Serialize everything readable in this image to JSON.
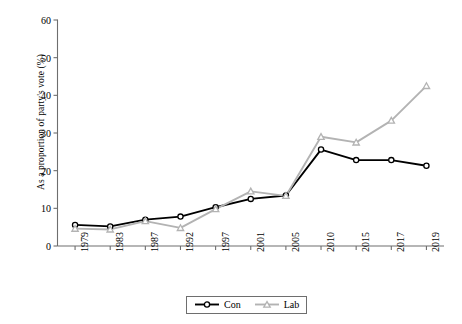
{
  "chart_data": {
    "type": "line",
    "title": "",
    "subtitle": "",
    "xlabel": "",
    "ylabel": "As a proportion of party's vote (%)",
    "categories": [
      "1979",
      "1983",
      "1987",
      "1992",
      "1997",
      "2001",
      "2005",
      "2010",
      "2015",
      "2017",
      "2019"
    ],
    "x": [
      1979,
      1983,
      1987,
      1992,
      1997,
      2001,
      2005,
      2010,
      2015,
      2017,
      2019
    ],
    "ylim": [
      0,
      60
    ],
    "yticks": [
      0,
      10,
      20,
      30,
      40,
      50,
      60
    ],
    "grid": false,
    "legend_position": "bottom-center",
    "series": [
      {
        "name": "Con",
        "color": "#000000",
        "marker": "circle",
        "values": [
          5.6,
          5.2,
          7.0,
          7.8,
          10.3,
          12.5,
          13.4,
          25.6,
          22.8,
          22.8,
          21.3
        ]
      },
      {
        "name": "Lab",
        "color": "#b3b3b3",
        "marker": "triangle",
        "values": [
          4.6,
          4.4,
          6.6,
          4.8,
          9.8,
          14.5,
          13.3,
          29.0,
          27.5,
          33.3,
          42.5
        ]
      }
    ]
  },
  "axes": {
    "y_tick_labels": [
      "0",
      "10",
      "20",
      "30",
      "40",
      "50",
      "60"
    ],
    "x_tick_labels": [
      "1979",
      "1983",
      "1987",
      "1992",
      "1997",
      "2001",
      "2005",
      "2010",
      "2015",
      "2017",
      "2019"
    ],
    "y_title": "As a proportion of party's vote (%)"
  },
  "legend": {
    "entries": [
      {
        "label": "Con",
        "color": "#000000",
        "marker": "circle"
      },
      {
        "label": "Lab",
        "color": "#b3b3b3",
        "marker": "triangle"
      }
    ]
  },
  "colors": {
    "con": "#000000",
    "lab": "#b3b3b3",
    "axis": "#6e6e6e",
    "background": "#ffffff"
  }
}
